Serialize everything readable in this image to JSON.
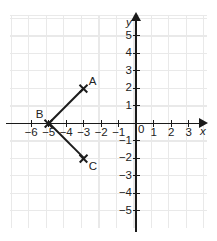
{
  "chart_data": {
    "type": "scatter",
    "title": "",
    "xlabel": "x",
    "ylabel": "y",
    "xlim": [
      -6.5,
      3.9
    ],
    "ylim": [
      -5.6,
      5.6
    ],
    "grid": true,
    "legend": "none",
    "x_ticks": [
      "-6",
      "-5",
      "-4",
      "-3",
      "-2",
      "-1",
      "1",
      "2",
      "3"
    ],
    "x_tick_values": [
      -6,
      -5,
      -4,
      -3,
      -2,
      -1,
      1,
      2,
      3
    ],
    "y_ticks": [
      "5",
      "4",
      "3",
      "2",
      "1",
      "-1",
      "-2",
      "-3",
      "-4",
      "-5"
    ],
    "y_tick_values": [
      5,
      4,
      3,
      2,
      1,
      -1,
      -2,
      -3,
      -4,
      -5
    ],
    "origin_label": "0",
    "points": [
      {
        "label": "A",
        "x": -3,
        "y": 2,
        "marker": "x",
        "label_pos": "upper-right"
      },
      {
        "label": "B",
        "x": -5,
        "y": 0,
        "marker": "x",
        "label_pos": "upper-left"
      },
      {
        "label": "C",
        "x": -3,
        "y": -2,
        "marker": "x",
        "label_pos": "lower-right"
      }
    ],
    "segments": [
      {
        "name": "BA",
        "from": "B",
        "to": "A"
      },
      {
        "name": "BC",
        "from": "B",
        "to": "C"
      }
    ],
    "colors": {
      "grid": "#e9e9e9",
      "axis": "#1a1a1a",
      "segment": "#1c1c1c",
      "text": "#222222",
      "background": "#ffffff"
    }
  }
}
